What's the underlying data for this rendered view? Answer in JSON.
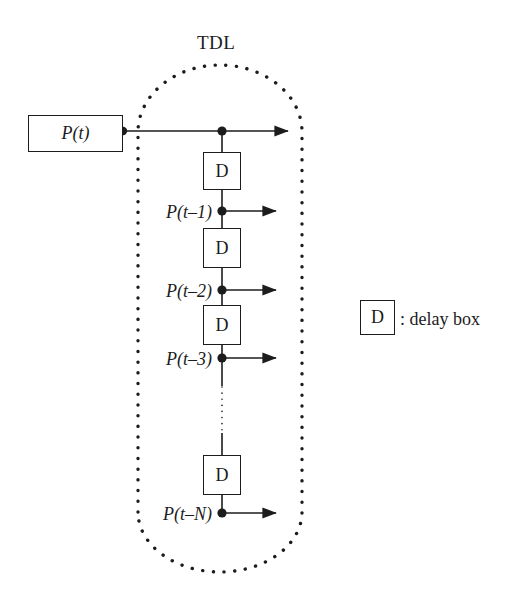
{
  "diagram": {
    "title": "TDL",
    "input_box": {
      "label": "P(t)"
    },
    "delay_box_letter": "D",
    "taps": [
      {
        "label": "P(t–1)"
      },
      {
        "label": "P(t–2)"
      },
      {
        "label": "P(t–3)"
      },
      {
        "label": "P(t–N)"
      }
    ],
    "ellipsis_hint": "vertical-dotted-continuation"
  },
  "legend": {
    "symbol": "D",
    "description": ": delay box"
  },
  "colors": {
    "ink": "#1c1c1c",
    "background": "#ffffff"
  }
}
